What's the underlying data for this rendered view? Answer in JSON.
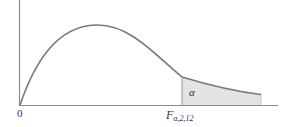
{
  "figure": {
    "type": "F-distribution density with upper-tail critical region",
    "origin_label": "0",
    "critical_value_label": {
      "main": "F",
      "subscript": "α,2,12"
    },
    "tail_area_label": "α",
    "colors": {
      "axis": "#8a8a8a",
      "curve": "#7a7a7a",
      "tail_fill": "#e3e3e3",
      "text": "#333333"
    }
  }
}
